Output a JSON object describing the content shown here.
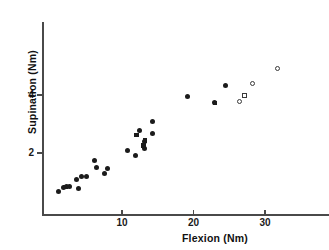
{
  "chart_data": {
    "type": "scatter",
    "title": "",
    "xlabel": "Flexion  (Nm)",
    "ylabel": "Supination  (Nm)",
    "xlim": [
      0,
      34
    ],
    "ylim": [
      0,
      5.6
    ],
    "xticks": [
      10,
      20,
      30
    ],
    "xtick_labels": [
      "10",
      "20",
      "30"
    ],
    "yticks": [
      2,
      4
    ],
    "ytick_labels": [
      "2",
      "4"
    ],
    "grid": false,
    "legend": null,
    "series": [
      {
        "name": "filled-circle",
        "marker": "circle-filled",
        "points": [
          [
            1.1,
            0.68
          ],
          [
            1.8,
            0.8
          ],
          [
            2.3,
            0.84
          ],
          [
            2.6,
            0.86
          ],
          [
            3.6,
            1.1
          ],
          [
            3.9,
            0.79
          ],
          [
            4.4,
            1.19
          ],
          [
            5.1,
            1.19
          ],
          [
            6.2,
            1.73
          ],
          [
            6.4,
            1.51
          ],
          [
            7.6,
            1.31
          ],
          [
            8.0,
            1.46
          ],
          [
            10.7,
            2.1
          ],
          [
            11.9,
            1.9
          ],
          [
            12.4,
            2.76
          ],
          [
            13.1,
            2.38
          ],
          [
            13.2,
            2.17
          ],
          [
            14.2,
            3.09
          ],
          [
            14.3,
            2.67
          ],
          [
            19.2,
            3.96
          ],
          [
            22.9,
            3.73
          ],
          [
            24.5,
            4.32
          ]
        ]
      },
      {
        "name": "filled-square",
        "marker": "square-filled",
        "points": [
          [
            2.1,
            0.83
          ],
          [
            13.0,
            2.25
          ],
          [
            13.2,
            2.43
          ],
          [
            12.0,
            2.62
          ],
          [
            23.0,
            3.72
          ]
        ]
      },
      {
        "name": "open-circle",
        "marker": "circle-open",
        "points": [
          [
            26.5,
            3.78
          ],
          [
            28.2,
            4.4
          ],
          [
            31.8,
            4.92
          ]
        ]
      },
      {
        "name": "open-square",
        "marker": "square-open",
        "points": [
          [
            27.1,
            3.97
          ]
        ]
      }
    ]
  },
  "axes": {
    "x_title": "Flexion  (Nm)",
    "y_title": "Supination  (Nm)"
  }
}
